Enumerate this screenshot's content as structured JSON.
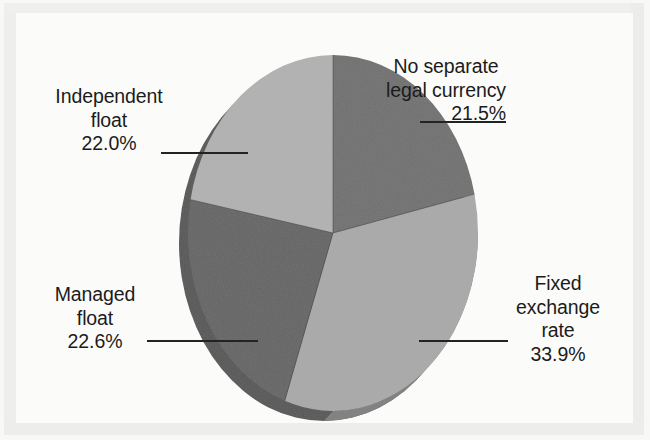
{
  "chart_data": {
    "type": "pie",
    "title": "",
    "subtitle": "",
    "xlabel": "",
    "ylabel": "",
    "legend_position": "none",
    "grid": false,
    "start_angle_deg": 0,
    "direction": "clockwise",
    "three_d": true,
    "total_percent": "100.0%",
    "categories": [
      "No separate legal currency",
      "Fixed exchange rate",
      "Managed float",
      "Independent float"
    ],
    "values": [
      21.5,
      33.9,
      22.6,
      22.0
    ],
    "value_labels": [
      "21.5%",
      "33.9%",
      "22.6%",
      "22.0%"
    ],
    "slices": [
      {
        "name": "No separate legal currency",
        "label_lines": [
          "No separate",
          "legal currency"
        ],
        "percent": 21.5,
        "percent_label": "21.5%",
        "color": "#6f6f6f",
        "side_color": "#5a5a5a",
        "position": "top-right"
      },
      {
        "name": "Fixed exchange rate",
        "label_lines": [
          "Fixed",
          "exchange",
          "rate"
        ],
        "percent": 33.9,
        "percent_label": "33.9%",
        "color": "#a9a9a9",
        "side_color": "#8d8d8d",
        "position": "bottom-right"
      },
      {
        "name": "Managed float",
        "label_lines": [
          "Managed",
          "float"
        ],
        "percent": 22.6,
        "percent_label": "22.6%",
        "color": "#636363",
        "side_color": "#4f4f4f",
        "position": "bottom-left"
      },
      {
        "name": "Independent float",
        "label_lines": [
          "Independent",
          "float"
        ],
        "percent": 22.0,
        "percent_label": "22.0%",
        "color": "#b1b1b1",
        "side_color": "#6a6a6a",
        "position": "top-left"
      }
    ]
  },
  "labels": {
    "no_separate_legal_currency": {
      "line1": "No separate",
      "line2": "legal currency",
      "percent": "21.5%"
    },
    "fixed_exchange_rate": {
      "line1": "Fixed",
      "line2": "exchange",
      "line3": "rate",
      "percent": "33.9%"
    },
    "independent_float": {
      "line1": "Independent",
      "line2": "float",
      "percent": "22.0%"
    },
    "managed_float": {
      "line1": "Managed",
      "line2": "float",
      "percent": "22.6%"
    }
  },
  "colors": {
    "page_background": "#fbfbfa",
    "frame": "#eeeeed",
    "text": "#1b1b1b",
    "leader_line": "#262626",
    "slice_dark": "#6f6f6f",
    "slice_light": "#a9a9a9",
    "slice_dark_2": "#636363",
    "slice_light_2": "#b1b1b1"
  }
}
